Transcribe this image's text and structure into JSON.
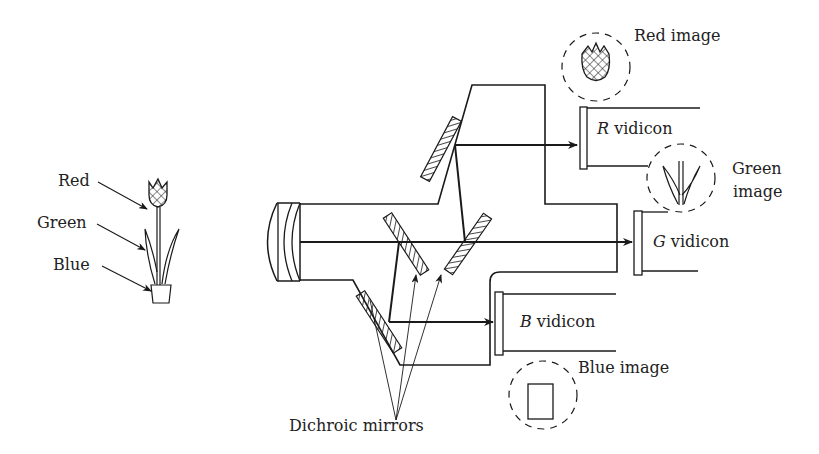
{
  "diagram": {
    "object_labels": {
      "red": "Red",
      "green": "Green",
      "blue": "Blue"
    },
    "vidicons": {
      "r": {
        "letter": "R",
        "suffix": " vidicon"
      },
      "g": {
        "letter": "G",
        "suffix": " vidicon"
      },
      "b": {
        "letter": "B",
        "suffix": " vidicon"
      }
    },
    "images": {
      "red": "Red image",
      "green_line1": "Green",
      "green_line2": "image",
      "blue": "Blue image"
    },
    "mirror_label": "Dichroic mirrors",
    "icons": {
      "tulip": "tulip-icon",
      "lens": "lens-icon",
      "mirror": "hatched-mirror-icon",
      "arrow": "arrow-icon"
    },
    "colors": {
      "line": "#1a1a1a",
      "background": "#ffffff"
    }
  }
}
